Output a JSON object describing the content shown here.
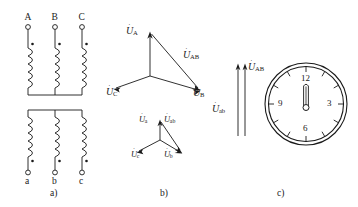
{
  "figure": {
    "captions": [
      {
        "id": "a",
        "label": "a)",
        "meaning": "winding connection diagram"
      },
      {
        "id": "b",
        "label": "b)",
        "meaning": "phasor diagrams of HV and LV voltages"
      },
      {
        "id": "c",
        "label": "c)",
        "meaning": "clock notation (clock hour number 0 / 12)"
      }
    ]
  },
  "panel_a": {
    "hv_terminals": [
      "A",
      "B",
      "C"
    ],
    "lv_terminals": [
      "a",
      "b",
      "c"
    ],
    "winding_count": 3,
    "hv_connection": "star (common point at bottom of HV coils)",
    "lv_connection": "star (common point at top of LV coils)",
    "polarity_marks": "dot above each HV coil and below each LV coil",
    "caption": "a)"
  },
  "panel_b": {
    "hv_phasors": [
      {
        "name": "U_A",
        "base": "U",
        "sub": "A",
        "direction": "up"
      },
      {
        "name": "U_B",
        "base": "U",
        "sub": "B",
        "direction": "lower-right"
      },
      {
        "name": "U_C",
        "base": "U",
        "sub": "C",
        "direction": "lower-left"
      },
      {
        "name": "U_AB",
        "base": "U",
        "sub": "AB",
        "direction": "from A tip to B tip"
      }
    ],
    "lv_phasors": [
      {
        "name": "U_a",
        "base": "U",
        "sub": "a",
        "direction": "up"
      },
      {
        "name": "U_b",
        "base": "U",
        "sub": "b",
        "direction": "lower-right"
      },
      {
        "name": "U_c",
        "base": "U",
        "sub": "c",
        "direction": "lower-left"
      },
      {
        "name": "U_ab",
        "base": "U",
        "sub": "ab",
        "direction": "from a tip to b tip"
      }
    ],
    "note": "LV star is in phase with HV star (phase displacement 0)",
    "caption": "b)"
  },
  "panel_c": {
    "arrow_labels": [
      {
        "base": "U",
        "sub": "AB",
        "position": "right arrow (HV line voltage)"
      },
      {
        "base": "U",
        "sub": "ab",
        "position": "left arrow (LV line voltage)"
      }
    ],
    "arrow_direction": "both vertical, pointing up (parallel, in phase)",
    "clock": {
      "numbers": [
        "12",
        "3",
        "6",
        "9"
      ],
      "tick_count": 12,
      "hour_hand": "12",
      "minute_hand": "12",
      "group_number": "0 (12 o'clock)",
      "rim": "double circle"
    },
    "caption": "c)"
  },
  "colors": {
    "ink": "#1a1a1a",
    "background": "#ffffff"
  }
}
